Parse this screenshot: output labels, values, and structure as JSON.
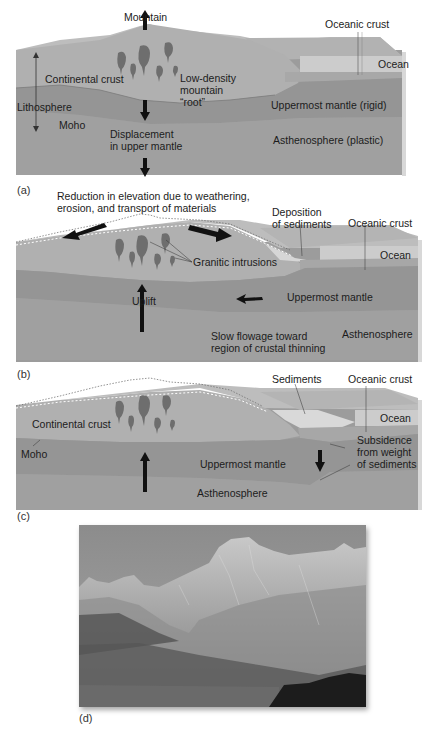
{
  "figure": {
    "panels": [
      {
        "id": "a",
        "label": "(a)",
        "labels": {
          "mountain": "Mountain",
          "oceanic_crust": "Oceanic crust",
          "ocean": "Ocean",
          "continental_crust": "Continental crust",
          "root": "Low-density\nmountain\n“root”",
          "lithosphere": "Lithosphere",
          "moho": "Moho",
          "uppermost_mantle": "Uppermost mantle (rigid)",
          "displacement": "Displacement\nin upper mantle",
          "asthenosphere": "Asthenosphere (plastic)"
        }
      },
      {
        "id": "b",
        "label": "(b)",
        "labels": {
          "reduction": "Reduction in elevation due to weathering,\nerosion, and transport of materials",
          "deposition": "Deposition\nof sediments",
          "oceanic_crust": "Oceanic crust",
          "ocean": "Ocean",
          "granitic": "Granitic intrusions",
          "uplift": "Uplift",
          "uppermost_mantle": "Uppermost mantle",
          "asthenosphere": "Asthenosphere",
          "flowage": "Slow flowage toward\nregion of crustal thinning"
        }
      },
      {
        "id": "c",
        "label": "(c)",
        "labels": {
          "sediments": "Sediments",
          "oceanic_crust": "Oceanic crust",
          "ocean": "Ocean",
          "continental_crust": "Continental crust",
          "moho": "Moho",
          "subsidence": "Subsidence\nfrom weight\nof sediments",
          "uppermost_mantle": "Uppermost mantle",
          "asthenosphere": "Asthenosphere"
        }
      },
      {
        "id": "d",
        "label": "(d)",
        "description": "Photograph of granite mountain peaks above a forested slope and lake"
      }
    ],
    "colors": {
      "crust": "#a9a9a9",
      "mantle": "#8e8e8e",
      "asthenosphere": "#9a9a9a",
      "ocean": "#c9c9c9",
      "sediment": "#d6d6d6",
      "intrusion": "#6e6e6e",
      "arrow": "#111111"
    }
  }
}
